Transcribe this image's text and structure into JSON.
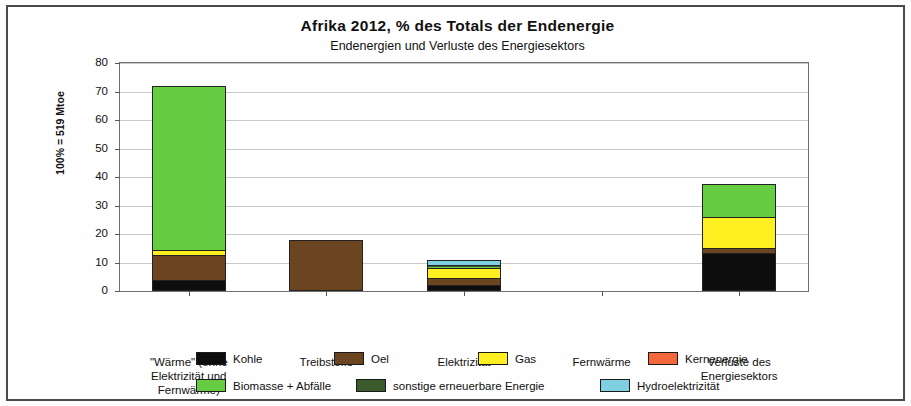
{
  "chart_data": {
    "type": "bar",
    "stacked": true,
    "title": "Afrika  2012,  % des Totals der Endenergie",
    "subtitle": "Endenergien und Verluste des Energiesektors",
    "xlabel": "",
    "ylabel": "100% = 519 Mtoe",
    "ylim": [
      0,
      80
    ],
    "yticks": [
      0,
      10,
      20,
      30,
      40,
      50,
      60,
      70,
      80
    ],
    "grid": true,
    "legend_position": "bottom",
    "categories": [
      "\"Wärme\" (ohne\nElektrizität und\nFernwärme)",
      "Treibstoffe",
      "Elektrizität",
      "Fernwärme",
      "Verluste des\nEnergiesektors"
    ],
    "category_lines": [
      [
        "\"Wärme\" (ohne",
        "Elektrizität und",
        "Fernwärme)"
      ],
      [
        "Treibstoffe"
      ],
      [
        "Elektrizität"
      ],
      [
        "Fernwärme"
      ],
      [
        "Verluste des",
        "Energiesektors"
      ]
    ],
    "series": [
      {
        "name": "Kohle",
        "color": "#0d0d0d",
        "values": [
          4.0,
          0.0,
          2.2,
          0.0,
          13.2
        ]
      },
      {
        "name": "Oel",
        "color": "#6b4420",
        "values": [
          8.5,
          18.0,
          2.3,
          0.0,
          2.0
        ]
      },
      {
        "name": "Gas",
        "color": "#ffef20",
        "values": [
          2.0,
          0.0,
          3.5,
          0.0,
          10.8
        ]
      },
      {
        "name": "Kernenergie",
        "color": "#f4663c",
        "values": [
          0.0,
          0.0,
          0.2,
          0.0,
          0.0
        ]
      },
      {
        "name": "Biomasse + Abfälle",
        "color": "#66cc41",
        "values": [
          57.5,
          0.0,
          0.3,
          0.0,
          11.6
        ]
      },
      {
        "name": "sonstige erneuerbare Energie",
        "color": "#3a5c2c",
        "values": [
          0.0,
          0.0,
          0.6,
          0.0,
          0.0
        ]
      },
      {
        "name": "Hydroelektrizität",
        "color": "#7fd0e0",
        "values": [
          0.0,
          0.0,
          1.7,
          0.0,
          0.0
        ]
      }
    ],
    "totals": [
      72.0,
      18.0,
      10.8,
      0.0,
      37.6
    ]
  },
  "legend": {
    "row1": [
      {
        "label": "Kohle",
        "color": "#0d0d0d"
      },
      {
        "label": "Oel",
        "color": "#6b4420"
      },
      {
        "label": "Gas",
        "color": "#ffef20"
      },
      {
        "label": "Kernenergie",
        "color": "#f4663c"
      }
    ],
    "row2": [
      {
        "label": "Biomasse + Abfälle",
        "color": "#66cc41"
      },
      {
        "label": "sonstige erneuerbare Energie",
        "color": "#3a5c2c"
      },
      {
        "label": "Hydroelektrizität",
        "color": "#7fd0e0"
      }
    ]
  }
}
